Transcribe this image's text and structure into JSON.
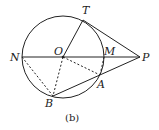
{
  "caption": "(b)",
  "points": {
    "O": {
      "label": "O",
      "x": 63,
      "y": 57
    },
    "T": {
      "label": "T",
      "x": 83,
      "y": 20
    },
    "N": {
      "label": "N",
      "x": 22,
      "y": 57
    },
    "M": {
      "label": "M",
      "x": 104,
      "y": 57
    },
    "P": {
      "label": "P",
      "x": 140,
      "y": 57
    },
    "A": {
      "label": "A",
      "x": 100,
      "y": 75
    },
    "B": {
      "label": "B",
      "x": 53,
      "y": 96
    }
  },
  "circle": {
    "cx": 63,
    "cy": 57,
    "r": 41
  },
  "colors": {
    "stroke": "#222222"
  }
}
